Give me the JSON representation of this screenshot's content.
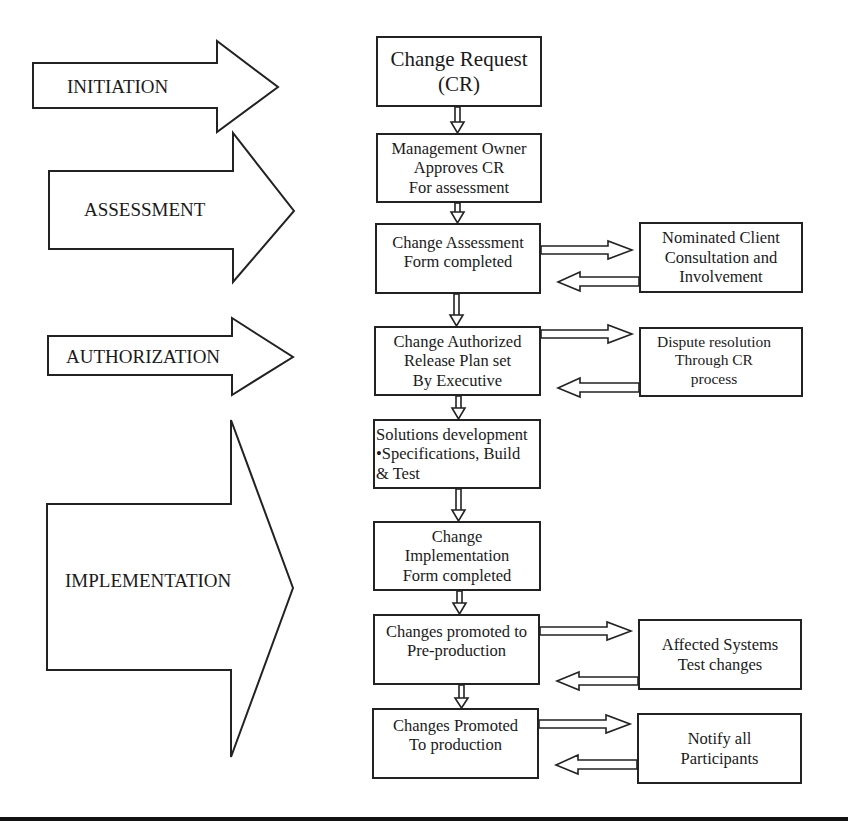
{
  "diagram": {
    "type": "change-management-process-flowchart",
    "colors": {
      "stroke": "#222222",
      "fill": "#ffffff",
      "text": "#1a1a1a"
    },
    "phases": [
      {
        "id": "initiation",
        "label": "INITIATION"
      },
      {
        "id": "assessment",
        "label": "ASSESSMENT"
      },
      {
        "id": "authorization",
        "label": "AUTHORIZATION"
      },
      {
        "id": "implementation",
        "label": "IMPLEMENTATION"
      }
    ],
    "steps": [
      {
        "id": "change-request",
        "lines": [
          "Change Request",
          "(CR)"
        ]
      },
      {
        "id": "management-approval",
        "lines": [
          "Management Owner",
          "Approves CR",
          "For assessment"
        ]
      },
      {
        "id": "change-assessment",
        "lines": [
          "Change Assessment",
          "Form completed"
        ]
      },
      {
        "id": "change-authorized",
        "lines": [
          "Change Authorized",
          "Release Plan set",
          "By Executive"
        ]
      },
      {
        "id": "solutions-development",
        "lines": [
          "Solutions development",
          "•Specifications, Build",
          "& Test"
        ]
      },
      {
        "id": "change-implementation",
        "lines": [
          "Change",
          "Implementation",
          "Form completed"
        ]
      },
      {
        "id": "pre-production",
        "lines": [
          "Changes promoted to",
          "Pre-production"
        ]
      },
      {
        "id": "production",
        "lines": [
          "Changes Promoted",
          "To production"
        ]
      }
    ],
    "side_steps": [
      {
        "id": "client-consultation",
        "connects_to": "change-assessment",
        "lines": [
          "Nominated Client",
          "Consultation and",
          "Involvement"
        ]
      },
      {
        "id": "dispute-resolution",
        "connects_to": "change-authorized",
        "lines": [
          "Dispute resolution",
          "Through CR",
          "process"
        ]
      },
      {
        "id": "affected-systems",
        "connects_to": "pre-production",
        "lines": [
          "Affected Systems",
          "Test changes"
        ]
      },
      {
        "id": "notify-participants",
        "connects_to": "production",
        "lines": [
          "Notify all",
          "Participants"
        ]
      }
    ]
  }
}
